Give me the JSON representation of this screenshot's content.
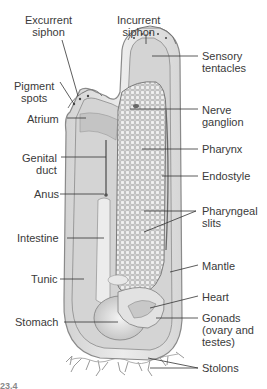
{
  "figure": {
    "caption_partial": "23.4"
  },
  "labels": {
    "excurrent_siphon": [
      "Excurrent",
      "siphon"
    ],
    "incurrent_siphon": [
      "Incurrent",
      "siphon"
    ],
    "sensory_tentacles": [
      "Sensory",
      "tentacles"
    ],
    "pigment_spots": [
      "Pigment",
      "spots"
    ],
    "atrium": [
      "Atrium"
    ],
    "nerve_ganglion": [
      "Nerve",
      "ganglion"
    ],
    "genital_duct": [
      "Genital",
      "duct"
    ],
    "pharynx": [
      "Pharynx"
    ],
    "endostyle": [
      "Endostyle"
    ],
    "anus": [
      "Anus"
    ],
    "pharyngeal_slits": [
      "Pharyngeal",
      "slits"
    ],
    "intestine": [
      "Intestine"
    ],
    "mantle": [
      "Mantle"
    ],
    "tunic": [
      "Tunic"
    ],
    "heart": [
      "Heart"
    ],
    "stomach": [
      "Stomach"
    ],
    "gonads": [
      "Gonads",
      "(ovary and",
      "testes)"
    ],
    "stolons": [
      "Stolons"
    ]
  },
  "colors": {
    "tunic_fill": "#e4e4e4",
    "tunic_stroke": "#8a8a8a",
    "mantle_fill": "#cfcfcf",
    "pharynx_fill": "#d9d9d9",
    "grid": "#9a9a9a",
    "leader": "#333333",
    "text": "#3a3a3a"
  }
}
